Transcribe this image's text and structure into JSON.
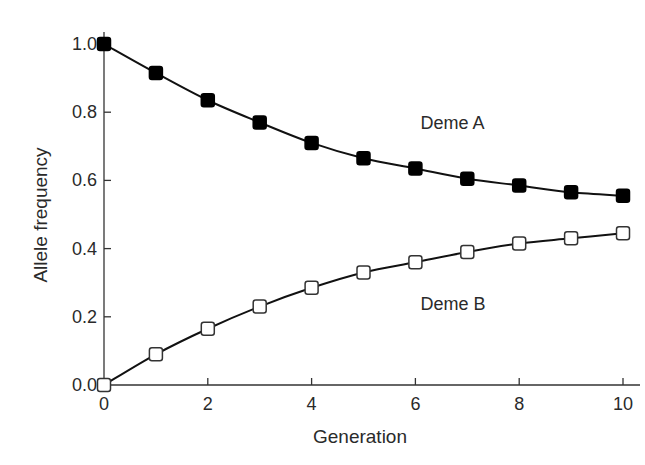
{
  "chart_data": {
    "type": "line",
    "title": "",
    "xlabel": "Generation",
    "ylabel": "Allele frequency",
    "x": [
      0,
      1,
      2,
      3,
      4,
      5,
      6,
      7,
      8,
      9,
      10
    ],
    "xlim": [
      0,
      10
    ],
    "ylim": [
      0.0,
      1.0
    ],
    "xticks": [
      "0",
      "2",
      "4",
      "6",
      "8",
      "10"
    ],
    "yticks": [
      "0.0",
      "0.2",
      "0.4",
      "0.6",
      "0.8",
      "1.0"
    ],
    "grid": false,
    "legend": "inline labels",
    "series": [
      {
        "name": "Deme A",
        "marker": "filled-square",
        "color": "#000000",
        "values": [
          1.0,
          0.915,
          0.835,
          0.77,
          0.71,
          0.665,
          0.635,
          0.605,
          0.585,
          0.565,
          0.555
        ]
      },
      {
        "name": "Deme B",
        "marker": "open-square",
        "color": "#000000",
        "values": [
          0.0,
          0.09,
          0.165,
          0.23,
          0.285,
          0.33,
          0.36,
          0.39,
          0.415,
          0.43,
          0.445
        ]
      }
    ],
    "annotations": [
      {
        "text": "Deme A",
        "x": 6.1,
        "y": 0.75
      },
      {
        "text": "Deme B",
        "x": 6.1,
        "y": 0.22
      }
    ]
  }
}
